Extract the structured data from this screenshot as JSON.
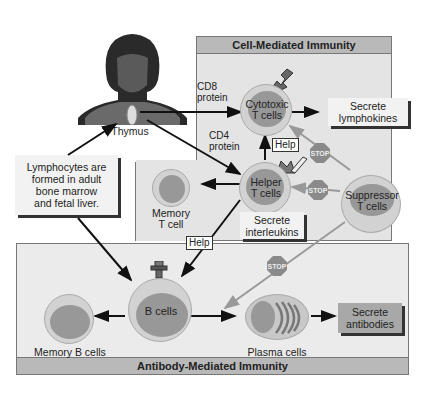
{
  "panels": {
    "cell_mediated": {
      "title": "Cell-Mediated Immunity"
    },
    "antibody_mediated": {
      "title": "Antibody-Mediated Immunity"
    }
  },
  "labels": {
    "thymus": "Thymus",
    "cd8": "CD8",
    "cd8_protein": "protein",
    "cd4": "CD4",
    "cd4_protein": "protein",
    "lymphocytes_box": [
      "Lymphocytes are",
      "formed in adult",
      "bone marrow",
      "and fetal liver."
    ]
  },
  "cells": {
    "cytotoxic": [
      "Cytotoxic",
      "T cells"
    ],
    "helper": [
      "Helper",
      "T cells"
    ],
    "suppressor": [
      "Suppressor",
      "T cells"
    ],
    "memory_t": [
      "Memory",
      "T cell"
    ],
    "b_cells": "B cells",
    "memory_b": "Memory B cells",
    "plasma": "Plasma cells"
  },
  "outputs": {
    "lymphokines": [
      "Secrete",
      "lymphokines"
    ],
    "interleukins": [
      "Secrete",
      "interleukins"
    ],
    "antibodies": [
      "Secrete",
      "antibodies"
    ]
  },
  "signals": {
    "help": "Help",
    "stop": "STOP"
  },
  "colors": {
    "panel_bg": "#e4e4e4",
    "title_bar": "#b9b9b9",
    "cell_outer": "#d2d2d2",
    "cell_inner": "#989898",
    "stop_sign": "#8a8a8a",
    "arrow": "#111111",
    "inhibit_arrow": "#9a9a9a"
  }
}
